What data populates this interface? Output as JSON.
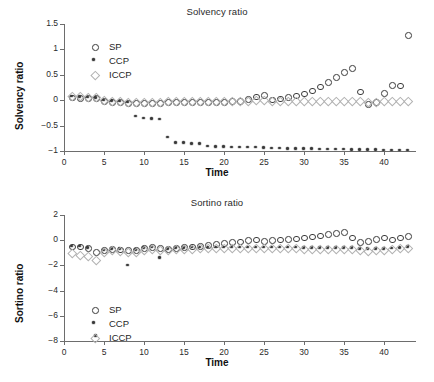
{
  "figure": {
    "background": "#ffffff",
    "marker_colors": {
      "SP": "#3b3b3b",
      "CCP": "#3a3a3a",
      "ICCP": "#b2b2b2"
    }
  },
  "panels": [
    {
      "key": "solvency",
      "title": "Solvency ratio",
      "xlabel": "Time",
      "ylabel": "Solvency ratio",
      "legend": [
        {
          "label": "SP",
          "marker": "circle-open"
        },
        {
          "label": "CCP",
          "marker": "asterisk-filled"
        },
        {
          "label": "ICCP",
          "marker": "diamond-open"
        }
      ],
      "xticks": [
        "0",
        "5",
        "10",
        "15",
        "20",
        "25",
        "30",
        "35",
        "40"
      ],
      "yticks": [
        "1.5",
        "1",
        "0.5",
        "0",
        "-0.5",
        "-1"
      ]
    },
    {
      "key": "sortino",
      "title": "Sortino ratio",
      "xlabel": "Time",
      "ylabel": "Sortino ratio",
      "legend": [
        {
          "label": "SP",
          "marker": "circle-open"
        },
        {
          "label": "CCP",
          "marker": "asterisk-filled"
        },
        {
          "label": "ICCP",
          "marker": "diamond-open"
        }
      ],
      "xticks": [
        "0",
        "5",
        "10",
        "15",
        "20",
        "25",
        "30",
        "35",
        "40"
      ],
      "yticks": [
        "2",
        "0",
        "-2",
        "-4",
        "-6",
        "-8"
      ]
    }
  ],
  "chart_data": [
    {
      "type": "scatter",
      "title": "Solvency ratio",
      "xlabel": "Time",
      "ylabel": "Solvency ratio",
      "xlim": [
        0,
        43.5
      ],
      "ylim": [
        -1.0,
        1.5
      ],
      "xticks": [
        0,
        5,
        10,
        15,
        20,
        25,
        30,
        35,
        40
      ],
      "yticks": [
        -1,
        -0.5,
        0,
        0.5,
        1,
        1.5
      ],
      "grid": false,
      "legend_position": "upper-left",
      "x": [
        1,
        2,
        3,
        4,
        5,
        6,
        7,
        8,
        9,
        10,
        11,
        12,
        13,
        14,
        15,
        16,
        17,
        18,
        19,
        20,
        21,
        22,
        23,
        24,
        25,
        26,
        27,
        28,
        29,
        30,
        31,
        32,
        33,
        34,
        35,
        36,
        37,
        38,
        39,
        40,
        41,
        42,
        43
      ],
      "series": [
        {
          "name": "SP",
          "marker": "circle-open",
          "color": "#3b3b3b",
          "values": [
            0.05,
            0.04,
            0.04,
            0.04,
            -0.02,
            -0.03,
            -0.04,
            -0.06,
            -0.05,
            -0.05,
            -0.05,
            -0.05,
            -0.04,
            -0.04,
            -0.04,
            -0.04,
            -0.04,
            -0.04,
            -0.03,
            -0.03,
            -0.02,
            -0.02,
            0.02,
            0.07,
            0.1,
            0.01,
            0.03,
            0.06,
            0.09,
            0.13,
            0.19,
            0.27,
            0.36,
            0.46,
            0.56,
            0.63,
            0.17,
            -0.08,
            -0.03,
            0.14,
            0.3,
            0.29,
            1.28
          ]
        },
        {
          "name": "CCP",
          "marker": "asterisk-filled",
          "color": "#3a3a3a",
          "values": [
            0.07,
            0.06,
            0.05,
            0.04,
            -0.01,
            -0.02,
            -0.03,
            -0.05,
            -0.32,
            -0.36,
            -0.37,
            -0.38,
            -0.74,
            -0.85,
            -0.85,
            -0.86,
            -0.86,
            -0.91,
            -0.92,
            -0.92,
            -0.93,
            -0.93,
            -0.93,
            -0.93,
            -0.94,
            -0.95,
            -0.95,
            -0.96,
            -0.96,
            -0.96,
            -0.96,
            -0.97,
            -0.97,
            -0.97,
            -0.97,
            -0.98,
            -0.98,
            -0.98,
            -0.98,
            -0.99,
            -0.99,
            -0.99,
            -0.99
          ]
        },
        {
          "name": "ICCP",
          "marker": "diamond-open",
          "color": "#b2b2b2",
          "values": [
            0.09,
            0.08,
            0.07,
            0.06,
            0.0,
            -0.01,
            -0.02,
            -0.04,
            -0.03,
            -0.03,
            -0.03,
            -0.03,
            -0.02,
            -0.02,
            -0.02,
            -0.02,
            -0.02,
            -0.02,
            -0.02,
            -0.01,
            -0.01,
            -0.01,
            -0.01,
            0.0,
            0.0,
            -0.01,
            -0.01,
            -0.01,
            -0.01,
            -0.01,
            -0.01,
            -0.02,
            -0.02,
            -0.02,
            -0.02,
            -0.02,
            -0.02,
            -0.03,
            -0.03,
            -0.02,
            -0.02,
            -0.02,
            -0.02
          ]
        }
      ]
    },
    {
      "type": "scatter",
      "title": "Sortino ratio",
      "xlabel": "Time",
      "ylabel": "Sortino ratio",
      "xlim": [
        0,
        43.5
      ],
      "ylim": [
        -8.0,
        2.0
      ],
      "xticks": [
        0,
        5,
        10,
        15,
        20,
        25,
        30,
        35,
        40
      ],
      "yticks": [
        -8,
        -6,
        -4,
        -2,
        0,
        2
      ],
      "grid": false,
      "legend_position": "lower-left",
      "x": [
        1,
        2,
        3,
        4,
        5,
        6,
        7,
        8,
        9,
        10,
        11,
        12,
        13,
        14,
        15,
        16,
        17,
        18,
        19,
        20,
        21,
        22,
        23,
        24,
        25,
        26,
        27,
        28,
        29,
        30,
        31,
        32,
        33,
        34,
        35,
        36,
        37,
        38,
        39,
        40,
        41,
        42,
        43
      ],
      "series": [
        {
          "name": "SP",
          "marker": "circle-open",
          "color": "#3b3b3b",
          "values": [
            -0.5,
            -0.5,
            -0.6,
            -0.95,
            -0.8,
            -0.72,
            -0.75,
            -0.8,
            -0.78,
            -0.6,
            -0.52,
            -0.6,
            -0.7,
            -0.62,
            -0.55,
            -0.5,
            -0.45,
            -0.4,
            -0.3,
            -0.22,
            -0.15,
            -0.1,
            0.0,
            0.05,
            -0.05,
            0.0,
            0.05,
            0.1,
            0.15,
            0.22,
            0.3,
            0.38,
            0.48,
            0.58,
            0.65,
            0.2,
            -0.15,
            -0.05,
            0.1,
            0.2,
            0.05,
            0.2,
            0.32
          ]
        },
        {
          "name": "CCP",
          "marker": "asterisk-filled",
          "color": "#3a3a3a",
          "values": [
            -0.52,
            -0.52,
            -0.62,
            -7.6,
            -0.82,
            -0.7,
            -0.72,
            -2.0,
            -0.8,
            -0.65,
            -0.6,
            -1.4,
            -0.72,
            -0.65,
            -0.62,
            -0.6,
            -0.58,
            -0.58,
            -0.58,
            -0.58,
            -0.58,
            -0.58,
            -0.58,
            -0.58,
            -0.6,
            -0.6,
            -0.6,
            -0.6,
            -0.6,
            -0.62,
            -0.62,
            -0.62,
            -0.62,
            -0.62,
            -0.62,
            -0.65,
            -0.7,
            -0.72,
            -0.7,
            -0.7,
            -0.68,
            -0.62,
            -0.55
          ]
        },
        {
          "name": "ICCP",
          "marker": "diamond-open",
          "color": "#b2b2b2",
          "values": [
            -1.0,
            -1.15,
            -1.25,
            -1.55,
            -0.95,
            -0.8,
            -0.82,
            -0.95,
            -0.92,
            -0.8,
            -0.72,
            -0.8,
            -0.8,
            -0.72,
            -0.68,
            -0.65,
            -0.62,
            -0.62,
            -0.6,
            -0.6,
            -0.6,
            -0.6,
            -0.6,
            -0.6,
            -0.62,
            -0.62,
            -0.62,
            -0.62,
            -0.62,
            -0.65,
            -0.65,
            -0.65,
            -0.65,
            -0.65,
            -0.65,
            -0.7,
            -0.8,
            -0.85,
            -0.8,
            -0.78,
            -0.72,
            -0.62,
            -0.58
          ]
        }
      ]
    }
  ]
}
